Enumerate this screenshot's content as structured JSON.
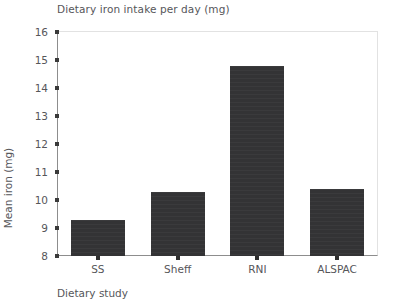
{
  "chart_data": {
    "type": "bar",
    "title": "Dietary iron intake per day (mg)",
    "xlabel": "Dietary study",
    "ylabel": "Mean iron (mg)",
    "categories": [
      "SS",
      "Sheff",
      "RNI",
      "ALSPAC"
    ],
    "values": [
      9.3,
      10.3,
      14.8,
      10.4
    ],
    "ylim": [
      8,
      16
    ],
    "yticks": [
      8,
      9,
      10,
      11,
      12,
      13,
      14,
      15,
      16
    ],
    "ytick_labels": [
      "8",
      "9",
      "10",
      "11",
      "12",
      "13",
      "14",
      "15",
      "16"
    ],
    "grid": false,
    "legend": null,
    "bar_color": "#333335",
    "axis_color": "#8d8d8d",
    "text_color": "#56565a"
  }
}
